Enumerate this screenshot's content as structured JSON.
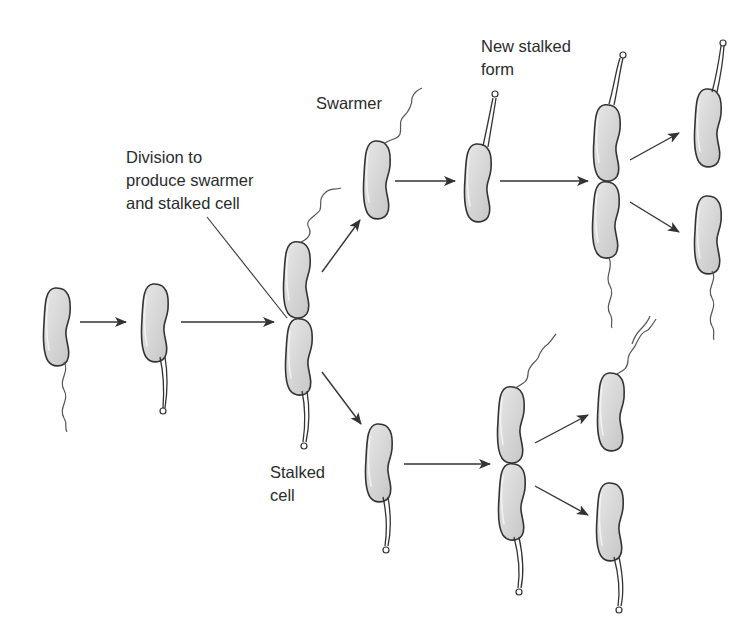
{
  "diagram": {
    "topic": "Caulobacter life cycle",
    "colors": {
      "background": "#ffffff",
      "cell_fill_light": "#e6e6e6",
      "cell_fill_dark": "#c8c8c8",
      "outline": "#333333",
      "text": "#2b2b2b"
    },
    "labels": {
      "division": "Division to\nproduce swarmer\nand stalked cell",
      "swarmer": "Swarmer",
      "new_stalked_form": "New stalked\nform",
      "stalked_cell": "Stalked\ncell"
    },
    "nodes": [
      {
        "id": "swarmer-start",
        "type": "swarmer cell with flagellum"
      },
      {
        "id": "stalked-1",
        "type": "stalked cell"
      },
      {
        "id": "dividing-1",
        "type": "dividing cell (flagellum top, stalk bottom)"
      },
      {
        "id": "swarmer-released",
        "type": "swarmer cell"
      },
      {
        "id": "new-stalked",
        "type": "new stalked form"
      },
      {
        "id": "dividing-upper",
        "type": "dividing cell (stalk top, flagellum bottom)"
      },
      {
        "id": "upper-stalked-daughter",
        "type": "stalked cell"
      },
      {
        "id": "upper-swarmer-daughter",
        "type": "swarmer cell"
      },
      {
        "id": "stalked-released",
        "type": "stalked cell"
      },
      {
        "id": "dividing-lower",
        "type": "dividing cell (flagellum top, stalk bottom)"
      },
      {
        "id": "lower-swarmer-daughter",
        "type": "swarmer cell"
      },
      {
        "id": "lower-stalked-daughter",
        "type": "stalked cell"
      }
    ],
    "edges": [
      [
        "swarmer-start",
        "stalked-1"
      ],
      [
        "stalked-1",
        "dividing-1"
      ],
      [
        "dividing-1",
        "swarmer-released"
      ],
      [
        "dividing-1",
        "stalked-released"
      ],
      [
        "swarmer-released",
        "new-stalked"
      ],
      [
        "new-stalked",
        "dividing-upper"
      ],
      [
        "dividing-upper",
        "upper-stalked-daughter"
      ],
      [
        "dividing-upper",
        "upper-swarmer-daughter"
      ],
      [
        "stalked-released",
        "dividing-lower"
      ],
      [
        "dividing-lower",
        "lower-swarmer-daughter"
      ],
      [
        "dividing-lower",
        "lower-stalked-daughter"
      ]
    ]
  }
}
